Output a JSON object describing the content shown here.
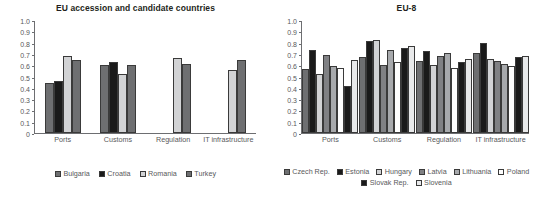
{
  "charts": [
    {
      "id": "eu-accession",
      "title": "EU accession and candidate countries",
      "ylim": [
        0,
        1.0
      ],
      "yticks": [
        "1.0",
        "0.9",
        "0.8",
        "0.7",
        "0.6",
        "0.5",
        "0.4",
        "0.3",
        "0.2",
        "0.1",
        "0"
      ],
      "categories": [
        "Ports",
        "Customs",
        "Regulation",
        "IT infrastructure"
      ],
      "series": [
        {
          "name": "Bulgaria",
          "color": "#6e6f71",
          "values": [
            0.45,
            0.61,
            null,
            null
          ]
        },
        {
          "name": "Croatia",
          "color": "#1a1a1a",
          "values": [
            0.46,
            0.63,
            null,
            null
          ]
        },
        {
          "name": "Romania",
          "color": "#d2d3d5",
          "values": [
            0.69,
            0.53,
            0.67,
            0.56
          ]
        },
        {
          "name": "Turkey",
          "color": "#6e6f71",
          "values": [
            0.65,
            0.61,
            0.62,
            0.65
          ]
        }
      ]
    },
    {
      "id": "eu-8",
      "title": "EU-8",
      "ylim": [
        0,
        1.0
      ],
      "yticks": [
        "1.0",
        "0.9",
        "0.8",
        "0.7",
        "0.6",
        "0.5",
        "0.4",
        "0.3",
        "0.2",
        "0.1",
        "0"
      ],
      "categories": [
        "Ports",
        "Customs",
        "Regulation",
        "IT infrastructure"
      ],
      "series": [
        {
          "name": "Czech Rep.",
          "color": "#6e6f71",
          "values": [
            0.57,
            0.68,
            0.64,
            0.71
          ]
        },
        {
          "name": "Estonia",
          "color": "#1a1a1a",
          "values": [
            0.74,
            0.82,
            0.73,
            0.8
          ]
        },
        {
          "name": "Hungary",
          "color": "#d2d3d5",
          "values": [
            0.53,
            0.83,
            0.61,
            0.66
          ]
        },
        {
          "name": "Latvia",
          "color": "#808184",
          "values": [
            0.7,
            0.61,
            0.69,
            0.64
          ]
        },
        {
          "name": "Lithuania",
          "color": "#a7a9ac",
          "values": [
            0.6,
            0.74,
            0.71,
            0.62
          ]
        },
        {
          "name": "Poland",
          "color": "#fdfdfd",
          "values": [
            0.58,
            0.63,
            0.58,
            0.6
          ]
        },
        {
          "name": "Slovak Rep.",
          "color": "#1a1a1a",
          "values": [
            0.42,
            0.76,
            0.63,
            0.68
          ]
        },
        {
          "name": "Slovenia",
          "color": "#e8e9ea",
          "values": [
            0.65,
            0.78,
            0.66,
            0.69
          ]
        }
      ]
    }
  ],
  "chart_data": [
    {
      "type": "bar",
      "title": "EU accession and candidate countries",
      "xlabel": "",
      "ylabel": "",
      "ylim": [
        0,
        1.0
      ],
      "grid": false,
      "legend_position": "bottom",
      "categories": [
        "Ports",
        "Customs",
        "Regulation",
        "IT infrastructure"
      ],
      "series": [
        {
          "name": "Bulgaria",
          "values": [
            0.45,
            0.61,
            null,
            null
          ]
        },
        {
          "name": "Croatia",
          "values": [
            0.46,
            0.63,
            null,
            null
          ]
        },
        {
          "name": "Romania",
          "values": [
            0.69,
            0.53,
            0.67,
            0.56
          ]
        },
        {
          "name": "Turkey",
          "values": [
            0.65,
            0.61,
            0.62,
            0.65
          ]
        }
      ],
      "ytick_labels": [
        "0",
        "0.1",
        "0.2",
        "0.3",
        "0.4",
        "0.5",
        "0.6",
        "0.7",
        "0.8",
        "0.9",
        "1.0"
      ]
    },
    {
      "type": "bar",
      "title": "EU-8",
      "xlabel": "",
      "ylabel": "",
      "ylim": [
        0,
        1.0
      ],
      "grid": false,
      "legend_position": "bottom",
      "categories": [
        "Ports",
        "Customs",
        "Regulation",
        "IT infrastructure"
      ],
      "series": [
        {
          "name": "Czech Rep.",
          "values": [
            0.57,
            0.68,
            0.64,
            0.71
          ]
        },
        {
          "name": "Estonia",
          "values": [
            0.74,
            0.82,
            0.73,
            0.8
          ]
        },
        {
          "name": "Hungary",
          "values": [
            0.53,
            0.83,
            0.61,
            0.66
          ]
        },
        {
          "name": "Latvia",
          "values": [
            0.7,
            0.61,
            0.69,
            0.64
          ]
        },
        {
          "name": "Lithuania",
          "values": [
            0.6,
            0.74,
            0.71,
            0.62
          ]
        },
        {
          "name": "Poland",
          "values": [
            0.58,
            0.63,
            0.58,
            0.6
          ]
        },
        {
          "name": "Slovak Rep.",
          "values": [
            0.42,
            0.76,
            0.63,
            0.68
          ]
        },
        {
          "name": "Slovenia",
          "values": [
            0.65,
            0.78,
            0.66,
            0.69
          ]
        }
      ],
      "ytick_labels": [
        "0",
        "0.1",
        "0.2",
        "0.3",
        "0.4",
        "0.5",
        "0.6",
        "0.7",
        "0.8",
        "0.9",
        "1.0"
      ]
    }
  ]
}
